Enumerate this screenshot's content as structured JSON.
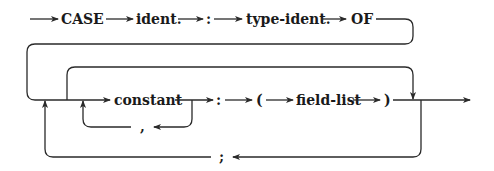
{
  "diagram": {
    "type": "syntax-diagram",
    "top_row": {
      "keyword_case": "CASE",
      "ident": "ident.",
      "colon": ":",
      "type_ident": "type-ident.",
      "keyword_of": "OF"
    },
    "main_row": {
      "constant": "constant",
      "colon": ":",
      "open_paren": "(",
      "field_list": "field-list",
      "close_paren": ")"
    },
    "loops": {
      "comma": ",",
      "semicolon": ";"
    }
  }
}
